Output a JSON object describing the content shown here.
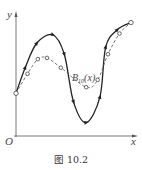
{
  "figure": {
    "caption": "图 10.2",
    "axis_labels": {
      "x": "x",
      "y": "y",
      "origin": "O"
    },
    "curve_label_main": "B",
    "curve_label_sub": "10",
    "curve_label_arg": "(x)"
  },
  "chart_data": {
    "type": "line",
    "title": "",
    "xlabel": "x",
    "ylabel": "y",
    "series": [
      {
        "name": "f(x) control polygon / original curve",
        "style": "solid",
        "marker": "triangle",
        "points": [
          [
            0,
            0.35
          ],
          [
            0.08,
            0.56
          ],
          [
            0.18,
            0.76
          ],
          [
            0.32,
            0.83
          ],
          [
            0.42,
            0.67
          ],
          [
            0.5,
            0.28
          ],
          [
            0.61,
            0.11
          ],
          [
            0.73,
            0.32
          ],
          [
            0.78,
            0.73
          ],
          [
            0.88,
            0.87
          ],
          [
            1.0,
            0.93
          ]
        ]
      },
      {
        "name": "B10(x)",
        "style": "dashed",
        "marker": "circle",
        "points": [
          [
            0,
            0.35
          ],
          [
            0.1,
            0.51
          ],
          [
            0.19,
            0.63
          ],
          [
            0.27,
            0.64
          ],
          [
            0.39,
            0.56
          ],
          [
            0.61,
            0.4
          ],
          [
            0.71,
            0.46
          ],
          [
            0.8,
            0.67
          ],
          [
            0.9,
            0.84
          ],
          [
            1.0,
            0.93
          ]
        ]
      }
    ],
    "annotations": [
      "B10(x)"
    ]
  }
}
